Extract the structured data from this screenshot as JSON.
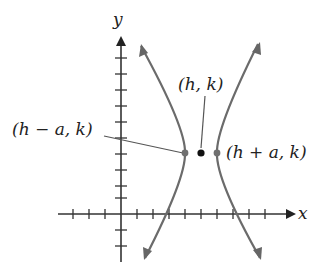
{
  "diagram": {
    "axes": {
      "x_label": "x",
      "y_label": "y"
    },
    "points": {
      "center": {
        "label": "(h, k)"
      },
      "left_vertex": {
        "label": "(h − a, k)"
      },
      "right_vertex": {
        "label": "(h + a, k)"
      }
    },
    "colors": {
      "axis": "#333333",
      "curve": "#6b6b6b",
      "center_point": "#111111",
      "vertex_point": "#707070",
      "label": "#222222"
    }
  }
}
